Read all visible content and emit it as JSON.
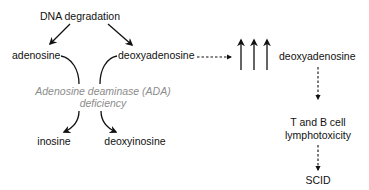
{
  "diagram": {
    "source": "DNA degradation",
    "left_product": "adenosine",
    "right_product": "deoxyadenosine",
    "enzyme_line1": "Adenosine deaminase (ADA)",
    "enzyme_line2": "deficiency",
    "left_blocked_product": "inosine",
    "right_blocked_product": "deoxyinosine",
    "accumulated": "deoxyadenosine",
    "effect_line1": "T and B cell",
    "effect_line2": "lymphotoxicity",
    "outcome": "SCID",
    "colors": {
      "text": "#111111",
      "enzyme_text": "#8c8c8c",
      "background": "#ffffff"
    }
  }
}
